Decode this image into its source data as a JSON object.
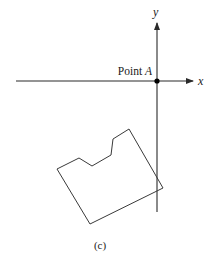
{
  "figure": {
    "caption": "(c)",
    "axes": {
      "x_label": "x",
      "y_label": "y",
      "origin": [
        157,
        81
      ],
      "x_axis": {
        "start": [
          16,
          81
        ],
        "end": [
          193,
          81
        ]
      },
      "y_axis": {
        "start": [
          157,
          212
        ],
        "end": [
          157,
          23
        ]
      }
    },
    "point": {
      "label_prefix": "Point ",
      "label_var": "A",
      "position": [
        157,
        81
      ]
    },
    "shape": {
      "description": "Rotated polygon with notched top edge",
      "vertices": [
        [
          57,
          169
        ],
        [
          79,
          158
        ],
        [
          92,
          166
        ],
        [
          111,
          155
        ],
        [
          113,
          139
        ],
        [
          129,
          129
        ],
        [
          163,
          188
        ],
        [
          90,
          224
        ]
      ]
    },
    "colors": {
      "line": "#3a3a3a",
      "axis": "#2a2a2a",
      "point": "#000000",
      "background": "#ffffff"
    }
  }
}
